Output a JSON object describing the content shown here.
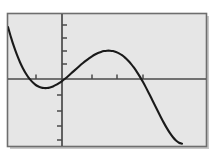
{
  "figure": {
    "title": "",
    "background_color": "#ffffff",
    "plot_area": {
      "fill_color": "#e6e6e6",
      "border_color": "#6b6b6b",
      "shadow_color": "#c8c8c8",
      "x_px": 7,
      "y_px": 13,
      "width_px": 200,
      "height_px": 134
    },
    "axis": {
      "color": "#4a4a4a",
      "curve_color": "#1a1a1a",
      "curve_width_px": 2.1,
      "x_axis_y_px": 79,
      "y_axis_x_px": 62,
      "tick_length_px": 5
    }
  },
  "chart_data": {
    "type": "line",
    "title": "",
    "subtitle": "",
    "xlabel": "",
    "ylabel": "",
    "grid": false,
    "legend": null,
    "legend_position": "none",
    "annotations": [],
    "xlim": [
      -2.75,
      7.25
    ],
    "ylim": [
      -10.0,
      6.5
    ],
    "xticks": [
      -1,
      1,
      2,
      3
    ],
    "yticks": [
      -8,
      -6,
      -4,
      -2,
      2,
      4,
      6
    ],
    "xtick_labels": [
      "",
      "",
      "",
      ""
    ],
    "ytick_labels": [
      "",
      "",
      "",
      "",
      "",
      "",
      ""
    ],
    "x_axis_at_y": 0,
    "y_axis_at_x": 0,
    "series": [
      {
        "name": "curve",
        "color": "#1a1a1a",
        "x": [
          -2.7,
          -2.55,
          -2.4,
          -2.25,
          -2.1,
          -1.95,
          -1.8,
          -1.65,
          -1.5,
          -1.35,
          -1.2,
          -1.05,
          -0.9,
          -0.75,
          -0.6,
          -0.45,
          -0.3,
          -0.15,
          0.0,
          0.15,
          0.3,
          0.45,
          0.6,
          0.75,
          0.9,
          1.05,
          1.2,
          1.35,
          1.5,
          1.65,
          1.8,
          1.95,
          2.1,
          2.25,
          2.4,
          2.55,
          2.7,
          2.85,
          3.0,
          3.15,
          3.3,
          3.45,
          3.6,
          3.75,
          3.9,
          4.05,
          4.2,
          4.35,
          4.5,
          4.65,
          4.8,
          4.95,
          5.1,
          5.25,
          5.4,
          5.55,
          5.7,
          5.85,
          6.0
        ],
        "y": [
          4.77,
          3.5,
          2.35,
          1.33,
          0.44,
          -0.33,
          -0.98,
          -1.52,
          -1.95,
          -2.28,
          -2.52,
          -2.67,
          -2.74,
          -2.74,
          -2.67,
          -2.54,
          -2.36,
          -2.14,
          -1.88,
          -1.59,
          -1.28,
          -0.96,
          -0.63,
          -0.3,
          0.03,
          0.34,
          0.64,
          0.92,
          1.17,
          1.39,
          1.57,
          1.71,
          1.81,
          1.86,
          1.86,
          1.81,
          1.7,
          1.53,
          1.3,
          1.01,
          0.66,
          0.24,
          -0.24,
          -0.78,
          -1.37,
          -2.01,
          -2.69,
          -3.4,
          -4.14,
          -4.88,
          -5.63,
          -6.36,
          -7.06,
          -7.71,
          -8.3,
          -8.8,
          -9.2,
          -9.47,
          -9.59
        ],
        "description": "quartic polynomial curve"
      }
    ],
    "curve_features": {
      "local_minimum_left": {
        "x": -0.83,
        "y": -2.75
      },
      "local_maximum": {
        "x": 2.32,
        "y": 1.87
      },
      "local_minimum_right": {
        "x": 6.05,
        "y": -9.6
      },
      "x_intercepts": [
        -2.0,
        0.87,
        3.58,
        8.2
      ],
      "enters_left_edge_at_y": 4.8,
      "exits_top_right": true
    }
  },
  "accessibility": {
    "alt_text": "Graph of a quartic polynomial on a gray plot region with a local minimum left of the y-axis, a local maximum, a deep minimum near the bottom, then rising steeply off the top right."
  }
}
